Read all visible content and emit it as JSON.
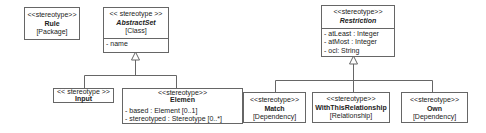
{
  "diagram": {
    "type": "uml-profile-class-diagram",
    "elements": {
      "rule": {
        "stereotype": "<<stereotype>>",
        "name": "Rule",
        "kind": "[Package]"
      },
      "abstract_set": {
        "stereotype": "<< stereotype >>",
        "name": "AbstractSet",
        "kind": "[Class]",
        "attributes": [
          "- name"
        ]
      },
      "input": {
        "stereotype": "<< stereotype >>",
        "name": "Input"
      },
      "elemen": {
        "stereotype": "<<stereotype>>",
        "name": "Elemen",
        "attributes": [
          "- based : Element [0..1]",
          "- stereotyped : Stereotype [0..*]"
        ]
      },
      "restriction": {
        "stereotype": "<<stereotype>>",
        "name": "Restriction",
        "attributes": [
          "- atLeast : Integer",
          "- atMost : Integer",
          "- ocl: String"
        ]
      },
      "match": {
        "stereotype": "<<stereotype>>",
        "name": "Match",
        "kind": "[Dependency]"
      },
      "with_this_relationship": {
        "stereotype": "<<stereotype>>",
        "name": "WithThisRelationship",
        "kind": "[Relationship]"
      },
      "own": {
        "stereotype": "<<stereotype>>",
        "name": "Own",
        "kind": "[Dependency]"
      }
    },
    "generalizations": [
      {
        "parent": "AbstractSet",
        "children": [
          "Input",
          "Elemen"
        ]
      },
      {
        "parent": "Restriction",
        "children": [
          "Match",
          "WithThisRelationship",
          "Own"
        ]
      }
    ],
    "line_color": "#666666"
  }
}
